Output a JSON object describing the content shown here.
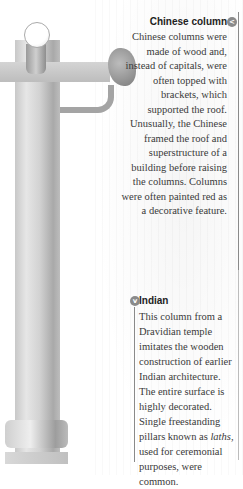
{
  "chinese": {
    "title": "Chinese column",
    "icon": "chevron-left-icon",
    "icon_glyph": "<",
    "body": "Chinese columns were made of wood and, instead of capitals, were often topped with brackets, which supported the roof. Unusually, the Chinese framed the roof and superstructure of a building before raising the columns. Columns were often painted red as a decorative feature."
  },
  "indian": {
    "title": "Indian",
    "icon": "chevron-down-icon",
    "icon_glyph": "v",
    "body_before": "This column from a Dravidian temple imitates the wooden construction of earlier Indian architecture. The entire surface is highly decorated. Single freestanding pillars known as ",
    "body_em": "laths",
    "body_after": ", used for ceremonial purposes, were common."
  },
  "colors": {
    "icon_gray": "#8a8a8a",
    "text": "#3a3a3a"
  }
}
